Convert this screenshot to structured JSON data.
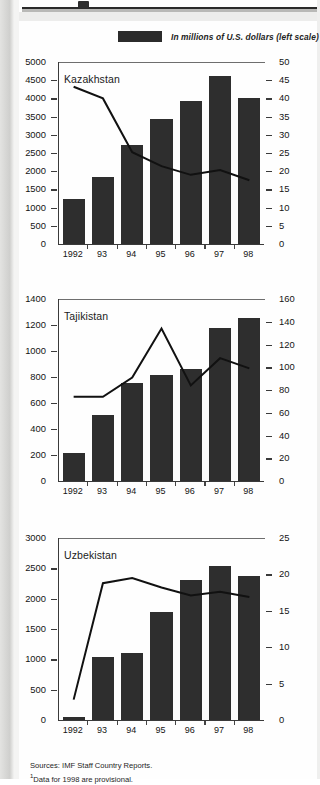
{
  "legend": {
    "swatch_name": "bar-series-swatch",
    "label": "In millions of U.S. dollars (left scale)",
    "color": "#2b2b2b"
  },
  "footnote": {
    "sources": "Sources:  IMF Staff Country Reports.",
    "note_marker": "1",
    "note": "Data for 1998 are provisional."
  },
  "colors": {
    "bar": "#2e2e2e",
    "line": "#111111",
    "axis": "#3a3a3a",
    "page": "#fefefe"
  },
  "chart_data": [
    {
      "type": "bar",
      "title": "Kazakhstan",
      "categories": [
        "1992",
        "93",
        "94",
        "95",
        "96",
        "97",
        "98"
      ],
      "xlabel": "",
      "ylabel": "",
      "grid": false,
      "legend_position": "top",
      "series": [
        {
          "name": "In millions of U.S. dollars (left scale)",
          "kind": "bar",
          "axis": "left",
          "values": [
            1240,
            1850,
            2720,
            3440,
            3920,
            4620,
            4020
          ]
        },
        {
          "name": "Right scale series",
          "kind": "line",
          "axis": "right",
          "values": [
            43.2,
            40.0,
            25.2,
            21.4,
            19.0,
            20.3,
            17.5
          ]
        }
      ],
      "left_axis": {
        "ylim": [
          0,
          5000
        ],
        "ticks": [
          0,
          500,
          1000,
          1500,
          2000,
          2500,
          3000,
          3500,
          4000,
          4500,
          5000
        ],
        "tick_labels": [
          "0",
          "500",
          "1000",
          "1500",
          "2000",
          "2500",
          "3000",
          "3500",
          "4000",
          "4500",
          "5000"
        ]
      },
      "right_axis": {
        "ylim": [
          0,
          50
        ],
        "ticks": [
          0,
          5,
          10,
          15,
          20,
          25,
          30,
          35,
          40,
          45,
          50
        ],
        "tick_labels": [
          "0",
          "5",
          "10",
          "15",
          "20",
          "25",
          "30",
          "35",
          "40",
          "45",
          "50"
        ]
      }
    },
    {
      "type": "bar",
      "title": "Tajikistan",
      "categories": [
        "1992",
        "93",
        "94",
        "95",
        "96",
        "97",
        "98"
      ],
      "xlabel": "",
      "ylabel": "",
      "grid": false,
      "legend_position": "top",
      "series": [
        {
          "name": "In millions of U.S. dollars (left scale)",
          "kind": "bar",
          "axis": "left",
          "values": [
            215,
            510,
            755,
            815,
            865,
            1180,
            1255
          ]
        },
        {
          "name": "Right scale series",
          "kind": "line",
          "axis": "right",
          "values": [
            74,
            74,
            91,
            134,
            84,
            108,
            99
          ]
        }
      ],
      "left_axis": {
        "ylim": [
          0,
          1400
        ],
        "ticks": [
          0,
          200,
          400,
          600,
          800,
          1000,
          1200,
          1400
        ],
        "tick_labels": [
          "0",
          "200",
          "400",
          "600",
          "800",
          "1000",
          "1200",
          "1400"
        ]
      },
      "right_axis": {
        "ylim": [
          0,
          160
        ],
        "ticks": [
          0,
          20,
          40,
          60,
          80,
          100,
          120,
          140,
          160
        ],
        "tick_labels": [
          "0",
          "20",
          "40",
          "60",
          "80",
          "100",
          "120",
          "140",
          "160"
        ]
      }
    },
    {
      "type": "bar",
      "title": "Uzbekistan",
      "categories": [
        "1992",
        "93",
        "94",
        "95",
        "96",
        "97",
        "98"
      ],
      "xlabel": "",
      "ylabel": "",
      "grid": false,
      "legend_position": "top",
      "series": [
        {
          "name": "In millions of U.S. dollars (left scale)",
          "kind": "bar",
          "axis": "left",
          "values": [
            55,
            1040,
            1100,
            1780,
            2310,
            2540,
            2380
          ]
        },
        {
          "name": "Right scale series",
          "kind": "line",
          "axis": "right",
          "values": [
            2.8,
            18.8,
            19.5,
            18.2,
            17.1,
            17.6,
            16.9
          ]
        }
      ],
      "left_axis": {
        "ylim": [
          0,
          3000
        ],
        "ticks": [
          0,
          500,
          1000,
          1500,
          2000,
          2500,
          3000
        ],
        "tick_labels": [
          "0",
          "500",
          "1000",
          "1500",
          "2000",
          "2500",
          "3000"
        ]
      },
      "right_axis": {
        "ylim": [
          0,
          25
        ],
        "ticks": [
          0,
          5,
          10,
          15,
          20,
          25
        ],
        "tick_labels": [
          "0",
          "5",
          "10",
          "15",
          "20",
          "25"
        ]
      }
    }
  ]
}
